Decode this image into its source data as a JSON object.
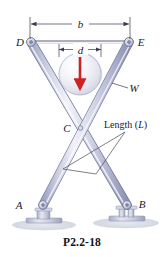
{
  "figure": {
    "caption": "P2.2-18",
    "type": "engineering-statics-diagram",
    "labels": {
      "point_a": "A",
      "point_b": "B",
      "point_c": "C",
      "point_d": "D",
      "point_e": "E",
      "weight": "W",
      "dim_b": "b",
      "dim_d": "d",
      "length_prefix": "Length (",
      "length_symbol": "L",
      "length_suffix": ")"
    },
    "colors": {
      "bar_fill_light": "#e8e9f4",
      "bar_fill_mid": "#b9bcd6",
      "bar_fill_dark": "#9498ba",
      "bar_stroke": "#6f7392",
      "sphere_light": "#fcfcfe",
      "sphere_mid": "#e3e4ef",
      "sphere_edge": "#a8abc4",
      "arrow_red": "#cc2222",
      "ground": "#d7dbe4",
      "line_dark": "#2a2a3a",
      "leader": "#3a3a4e",
      "text": "#1a1a28"
    },
    "geometry": {
      "d_pivot": [
        31,
        42
      ],
      "e_pivot": [
        129,
        42
      ],
      "a_pivot": [
        43,
        206
      ],
      "b_pivot": [
        127,
        206
      ],
      "crossing_c": [
        80,
        128
      ],
      "sphere_center": [
        80,
        74
      ],
      "sphere_radius": 21,
      "dim_b_y": 24,
      "dim_b_x1": 30,
      "dim_b_x2": 130,
      "dim_d_y": 49,
      "dim_d_x1": 59,
      "dim_d_x2": 101
    }
  }
}
